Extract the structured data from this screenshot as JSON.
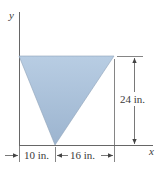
{
  "figure": {
    "type": "triangular-area-diagram",
    "axes": {
      "x_label": "x",
      "y_label": "y"
    },
    "shape": {
      "kind": "triangle",
      "fill_top": "#b6cce2",
      "fill_bottom": "#9db5cf",
      "stroke": "#7f93a8"
    },
    "dimensions": {
      "height": "24 in.",
      "left_width": "10 in.",
      "right_width": "16 in."
    },
    "colors": {
      "line": "#555555",
      "text": "#3a3a3a"
    }
  }
}
